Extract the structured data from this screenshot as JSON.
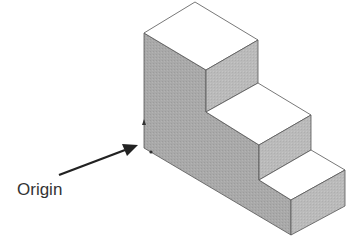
{
  "diagram": {
    "type": "isometric-step-block",
    "label_text": "Origin",
    "steps": 3,
    "colors": {
      "top_face": "#ffffff",
      "side_face": "#a7a7a7",
      "right_face": "#b9b9b9",
      "edge": "#555555",
      "arrow": "#222222",
      "label": "#333333"
    }
  }
}
